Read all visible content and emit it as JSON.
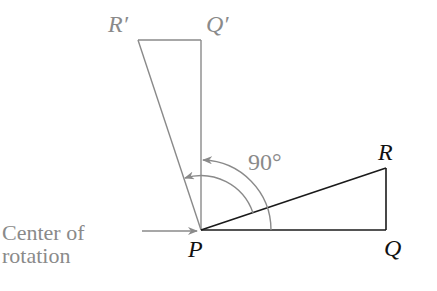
{
  "diagram": {
    "colors": {
      "original": "#1a1a1a",
      "image": "#8a8a8a",
      "annotation": "#8a8a8a",
      "label_dark": "#111111"
    },
    "points": {
      "P": {
        "label": "P",
        "x": 201,
        "y": 230
      },
      "Q": {
        "label": "Q",
        "x": 386,
        "y": 230
      },
      "R": {
        "label": "R",
        "x": 386,
        "y": 168
      },
      "Q_prime": {
        "label": "Q′",
        "x": 201,
        "y": 40
      },
      "R_prime": {
        "label": "R′",
        "x": 138,
        "y": 40
      }
    },
    "angle_label": "90°",
    "center_label_line1": "Center of",
    "center_label_line2": "rotation"
  }
}
